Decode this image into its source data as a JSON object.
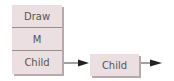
{
  "diagram": {
    "stack": {
      "cells": [
        {
          "label": "Draw"
        },
        {
          "label": "M"
        },
        {
          "label": "Child"
        }
      ]
    },
    "child_node": {
      "label": "Child"
    },
    "colors": {
      "box_fill": "#ecdfe2",
      "box_shadow": "#b9a9ad",
      "divider": "#9a8c90",
      "text": "#555555",
      "arrow": "#222222"
    }
  }
}
